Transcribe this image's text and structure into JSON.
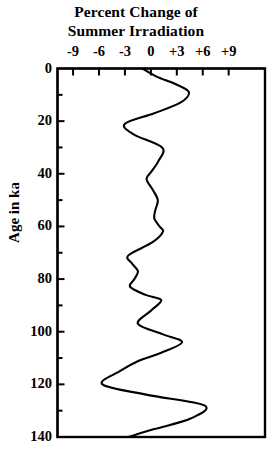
{
  "chart_data": {
    "type": "line",
    "title": "Percent Change of Summer Irradiation",
    "title_line1": "Percent Change of",
    "title_line2": "Summer Irradiation",
    "xlabel": "Percent Change of Summer Irradiation",
    "ylabel": "Age in ka",
    "orientation": "vertical-depth",
    "grid": false,
    "legend": null,
    "xlim": [
      -10.8,
      13.2
    ],
    "ylim": [
      0,
      140
    ],
    "y_inverted": true,
    "xticks": [
      -9,
      -6,
      -3,
      0,
      3,
      6,
      9
    ],
    "xtick_labels": [
      "-9",
      "-6",
      "-3",
      "0",
      "+3",
      "+6",
      "+9"
    ],
    "yticks": [
      0,
      20,
      40,
      60,
      80,
      100,
      120,
      140
    ],
    "ytick_labels": [
      "0",
      "20",
      "40",
      "60",
      "80",
      "100",
      "120",
      "140"
    ],
    "y_minor_ticks": [
      10,
      30,
      50,
      70,
      90,
      110,
      130
    ],
    "line_color": "#000000",
    "line_width": 2.1,
    "series": [
      {
        "name": "Summer irradiation anomaly",
        "x_unit": "percent",
        "y_unit": "ka",
        "age": [
          0,
          3,
          6,
          9,
          13,
          17,
          21,
          25,
          30,
          35,
          39,
          42,
          46,
          50,
          54,
          57,
          60,
          62,
          66,
          71,
          74,
          77,
          80,
          83,
          86,
          88,
          92,
          97,
          101,
          104,
          108,
          111,
          115,
          120,
          124,
          128,
          133,
          137,
          140
        ],
        "values": [
          -1.0,
          0.6,
          2.9,
          4.4,
          3.4,
          0.4,
          -3.0,
          -2.0,
          1.3,
          0.9,
          0.1,
          -0.5,
          0.2,
          0.8,
          0.5,
          0.4,
          1.0,
          1.4,
          0.2,
          -2.6,
          -2.2,
          -1.5,
          -1.9,
          -2.4,
          -0.6,
          1.2,
          0.0,
          -1.5,
          1.4,
          3.6,
          1.2,
          -1.4,
          -3.6,
          -5.6,
          -0.4,
          6.2,
          4.6,
          0.4,
          -2.6
        ]
      }
    ],
    "extrema": {
      "max_value": 6.2,
      "max_age": 128,
      "min_value": -5.6,
      "min_age": 120
    }
  },
  "axes": {
    "frame_color": "#000000",
    "frame_width": 2.2,
    "tick_length_major": 7,
    "tick_length_minor": 5
  }
}
